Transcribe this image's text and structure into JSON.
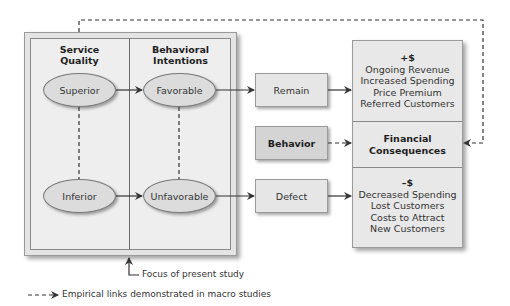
{
  "study_panel": {
    "col1_heading": "Service\nQuality",
    "col2_heading": "Behavioral\nIntentions",
    "col1_heading_line1": "Service",
    "col1_heading_line2": "Quality",
    "col2_heading_line1": "Behavioral",
    "col2_heading_line2": "Intentions",
    "nodes": {
      "superior": "Superior",
      "inferior": "Inferior",
      "favorable": "Favorable",
      "unfavorable": "Unfavorable"
    }
  },
  "behavior_boxes": {
    "remain": "Remain",
    "behavior": "Behavior",
    "defect": "Defect"
  },
  "financial": {
    "positive": {
      "title": "+$",
      "lines": [
        "Ongoing Revenue",
        "Increased Spending",
        "Price Premium",
        "Referred Customers"
      ]
    },
    "middle": {
      "line1": "Financial",
      "line2": "Consequences"
    },
    "negative": {
      "title": "–$",
      "lines": [
        "Decreased Spending",
        "Lost Customers",
        "Costs to Attract",
        "New Customers"
      ]
    }
  },
  "annotations": {
    "focus": "Focus of present study",
    "legend": "Empirical links demonstrated in macro studies"
  },
  "colors": {
    "box_fill": "#e6e6e6",
    "behavior_fill": "#d4d4d4",
    "ellipse_fill": "#dcdcdc",
    "line": "#333333"
  }
}
